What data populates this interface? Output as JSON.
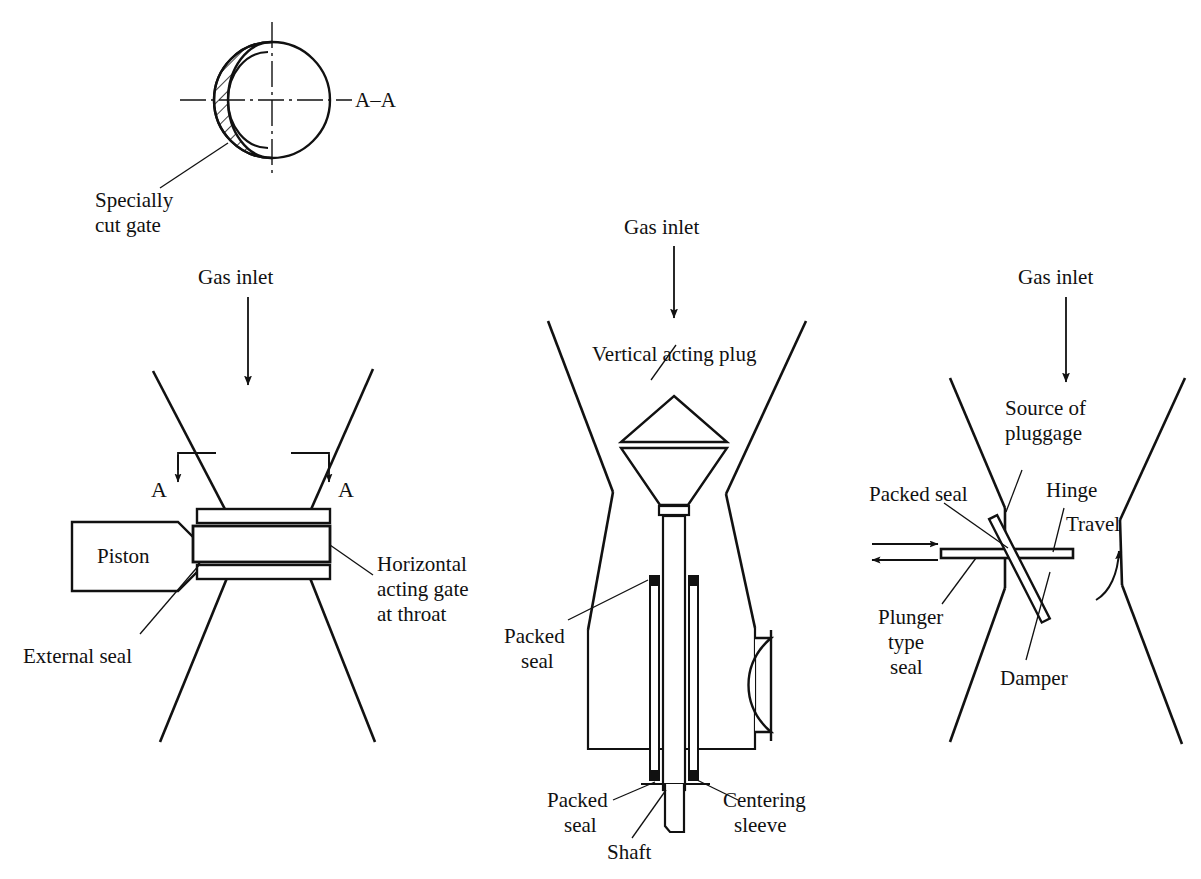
{
  "figure": {
    "stroke_color": "#111111",
    "background_color": "#ffffff"
  },
  "panels": [
    {
      "id": "section-aa",
      "name": "Section A-A of specially cut gate",
      "labels": {
        "section_tag": "A–A",
        "specially_cut_gate_line1": "Specially",
        "specially_cut_gate_line2": "cut gate"
      }
    },
    {
      "id": "horizontal-gate",
      "name": "Horizontal acting gate at throat",
      "labels": {
        "gas_inlet": "Gas inlet",
        "section_mark_left": "A",
        "section_mark_right": "A",
        "piston": "Piston",
        "external_seal": "External seal",
        "horizontal_gate_line1": "Horizontal",
        "horizontal_gate_line2": "acting gate",
        "horizontal_gate_line3": "at throat"
      }
    },
    {
      "id": "vertical-plug",
      "name": "Vertical acting plug",
      "labels": {
        "gas_inlet": "Gas inlet",
        "vertical_acting_plug": "Vertical acting plug",
        "packed_seal_upper_line1": "Packed",
        "packed_seal_upper_line2": "seal",
        "packed_seal_lower_line1": "Packed",
        "packed_seal_lower_line2": "seal",
        "shaft": "Shaft",
        "centering_sleeve_line1": "Centering",
        "centering_sleeve_line2": "sleeve"
      }
    },
    {
      "id": "plunger-damper",
      "name": "Plunger type seal with damper",
      "labels": {
        "gas_inlet": "Gas inlet",
        "source_of_pluggage_line1": "Source of",
        "source_of_pluggage_line2": "pluggage",
        "packed_seal": "Packed seal",
        "hinge": "Hinge",
        "travel": "Travel",
        "plunger_type_seal_line1": "Plunger",
        "plunger_type_seal_line2": "type",
        "plunger_type_seal_line3": "seal",
        "damper": "Damper"
      }
    }
  ]
}
